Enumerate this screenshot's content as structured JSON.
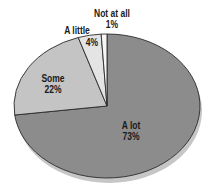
{
  "chart_data": {
    "type": "pie",
    "title": "",
    "categories": [
      "A lot",
      "Some",
      "A little",
      "Not at all"
    ],
    "values": [
      73,
      22,
      4,
      1
    ],
    "value_labels": [
      "73%",
      "22%",
      "4%",
      "1%"
    ],
    "colors": [
      "#8c8c8c",
      "#c4c4c4",
      "#e4e4e4",
      "#f6f6f6"
    ],
    "edge_color": "#2a2a2a",
    "shadow_color": "#bdbdbd",
    "start_angle_deg": 0,
    "direction": "clockwise",
    "legend": "none",
    "labels_position": "inside/outside on slices"
  },
  "labels": {
    "a_lot": {
      "name": "A lot",
      "pct": "73%"
    },
    "some": {
      "name": "Some",
      "pct": "22%"
    },
    "a_little": {
      "name": "A little",
      "pct": "4%"
    },
    "not_at_all": {
      "name": "Not at all",
      "pct": "1%"
    }
  }
}
